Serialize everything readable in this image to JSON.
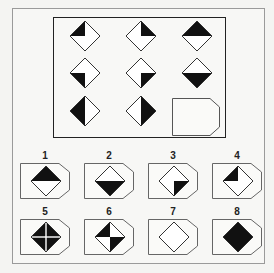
{
  "puzzle": {
    "grid": [
      {
        "row": 1,
        "col": 1,
        "fill": "top-left-quadrant"
      },
      {
        "row": 1,
        "col": 2,
        "fill": "top-right-quadrant"
      },
      {
        "row": 1,
        "col": 3,
        "fill": "top-half"
      },
      {
        "row": 2,
        "col": 1,
        "fill": "bottom-left-quadrant"
      },
      {
        "row": 2,
        "col": 2,
        "fill": "bottom-right-quadrant"
      },
      {
        "row": 2,
        "col": 3,
        "fill": "bottom-half"
      },
      {
        "row": 3,
        "col": 1,
        "fill": "left-half"
      },
      {
        "row": 3,
        "col": 2,
        "fill": "right-half"
      },
      {
        "row": 3,
        "col": 3,
        "fill": "missing"
      }
    ],
    "options": [
      {
        "label": "1",
        "fill": "top-half"
      },
      {
        "label": "2",
        "fill": "bottom-half"
      },
      {
        "label": "3",
        "fill": "bottom-right-quadrant"
      },
      {
        "label": "4",
        "fill": "top-left-quadrant"
      },
      {
        "label": "5",
        "fill": "all-quadrants-with-cross"
      },
      {
        "label": "6",
        "fill": "top-left-and-bottom-right"
      },
      {
        "label": "7",
        "fill": "empty"
      },
      {
        "label": "8",
        "fill": "solid"
      }
    ]
  },
  "colors": {
    "fill": "#111111",
    "stroke": "#333333",
    "frame": "#9a9a9a",
    "inner_frame": "#222222"
  }
}
